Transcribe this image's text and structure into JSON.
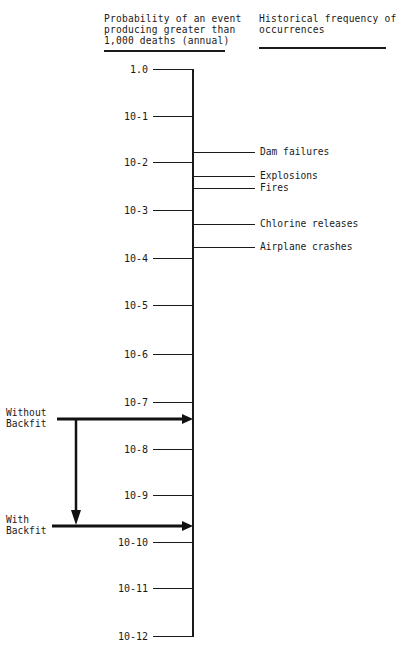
{
  "header": {
    "left": "Probability of an event\nproducing greater than\n1,000 deaths (annual)",
    "right": "Historical frequency of\noccurrences"
  },
  "axis": {
    "ticks": [
      {
        "label": "1.0",
        "y": 69
      },
      {
        "label": "10-1",
        "y": 116
      },
      {
        "label": "10-2",
        "y": 162
      },
      {
        "label": "10-3",
        "y": 210
      },
      {
        "label": "10-4",
        "y": 258
      },
      {
        "label": "10-5",
        "y": 305
      },
      {
        "label": "10-6",
        "y": 354
      },
      {
        "label": "10-7",
        "y": 402
      },
      {
        "label": "10-8",
        "y": 449
      },
      {
        "label": "10-9",
        "y": 495
      },
      {
        "label": "10-10",
        "y": 542
      },
      {
        "label": "10-11",
        "y": 588
      },
      {
        "label": "10-12",
        "y": 636
      }
    ]
  },
  "events": [
    {
      "label": "Dam failures",
      "y": 152
    },
    {
      "label": "Explosions",
      "y": 176
    },
    {
      "label": "Fires",
      "y": 188
    },
    {
      "label": "Chlorine releases",
      "y": 224
    },
    {
      "label": "Airplane crashes",
      "y": 247
    }
  ],
  "scenarios": {
    "without": {
      "label": "Without\nBackfit",
      "y": 419
    },
    "with": {
      "label": "With\nBackfit",
      "y": 526
    }
  }
}
